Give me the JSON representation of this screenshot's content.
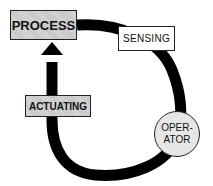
{
  "diagram": {
    "title": "",
    "nodes": {
      "process": "PROCESS",
      "sensing": "SENSING",
      "actuating": "ACTUATING",
      "operator_line1": "OPER-",
      "operator_line2": "ATOR"
    },
    "flow": [
      "PROCESS",
      "SENSING",
      "OPERATOR",
      "ACTUATING",
      "PROCESS"
    ],
    "colors": {
      "loop": "#000000",
      "box_fill": "#cfcfcf",
      "operator_fill": "#e6e6e6"
    }
  }
}
